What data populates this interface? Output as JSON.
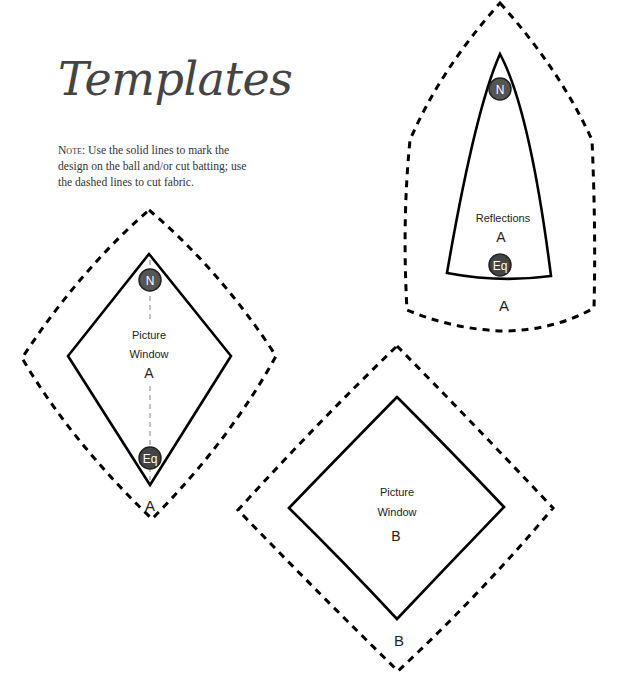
{
  "page": {
    "title": "Templates",
    "note": {
      "lead": "Note:",
      "text": " Use the solid lines to mark the design on the ball and/or cut batting; use the dashed lines to cut fabric."
    }
  },
  "templates": [
    {
      "id": "reflections-a",
      "name_line1": "Reflections",
      "letter": "A",
      "outer_label": "A",
      "badges": {
        "top": "N",
        "bottom": "Eq"
      }
    },
    {
      "id": "picture-window-a",
      "name_line1": "Picture",
      "name_line2": "Window",
      "letter": "A",
      "outer_label": "A",
      "badges": {
        "top": "N",
        "bottom": "Eq"
      }
    },
    {
      "id": "picture-window-b",
      "name_line1": "Picture",
      "name_line2": "Window",
      "letter": "B",
      "outer_label": "B"
    }
  ],
  "colors": {
    "line": "#000000",
    "badge_fill": "#555555",
    "title": "#444444"
  }
}
